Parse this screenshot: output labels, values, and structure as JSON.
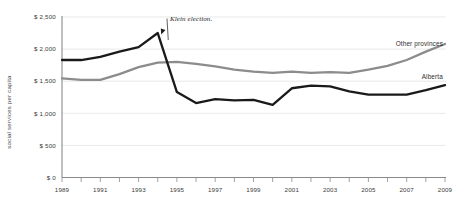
{
  "chart_data": {
    "type": "line",
    "title": "",
    "xlabel": "",
    "ylabel": "social services per capita",
    "xlim": [
      1989,
      2009
    ],
    "ylim": [
      0,
      2500
    ],
    "grid": true,
    "legend_position": "right-inline",
    "y_ticks": [
      0,
      500,
      1000,
      1500,
      2000,
      2500
    ],
    "y_tick_labels": [
      "$ 0",
      "$ 500",
      "$ 1,000",
      "$ 1,500",
      "$ 2,000",
      "$ 2,500"
    ],
    "x_ticks": [
      1989,
      1990,
      1991,
      1992,
      1993,
      1994,
      1995,
      1996,
      1997,
      1998,
      1999,
      2000,
      2001,
      2002,
      2003,
      2004,
      2005,
      2006,
      2007,
      2008,
      2009
    ],
    "x_tick_labels": [
      "1989",
      "",
      "1991",
      "",
      "1993",
      "",
      "1995",
      "",
      "1997",
      "",
      "1999",
      "",
      "2001",
      "",
      "2003",
      "",
      "2005",
      "",
      "2007",
      "",
      "2009"
    ],
    "x": [
      1989,
      1990,
      1991,
      1992,
      1993,
      1994,
      1995,
      1996,
      1997,
      1998,
      1999,
      2000,
      2001,
      2002,
      2003,
      2004,
      2005,
      2006,
      2007,
      2008,
      2009
    ],
    "series": [
      {
        "name": "Alberta",
        "color": "#1a1a1a",
        "values": [
          1830,
          1830,
          1880,
          1960,
          2030,
          2250,
          1330,
          1160,
          1220,
          1200,
          1210,
          1130,
          1390,
          1430,
          1420,
          1340,
          1290,
          1290,
          1290,
          1360,
          1440
        ]
      },
      {
        "name": "Other provinces",
        "color": "#8c8c8c",
        "values": [
          1545,
          1520,
          1520,
          1610,
          1720,
          1790,
          1800,
          1770,
          1730,
          1680,
          1650,
          1630,
          1650,
          1630,
          1640,
          1630,
          1680,
          1740,
          1830,
          1960,
          2080
        ]
      }
    ],
    "annotations": [
      {
        "text": "Klein election.",
        "target_x": 1994,
        "target_y": 2250
      }
    ]
  },
  "series_labels": {
    "other_provinces": "Other provinces",
    "alberta": "Alberta"
  },
  "axis": {
    "y_title": "social services per capita"
  }
}
